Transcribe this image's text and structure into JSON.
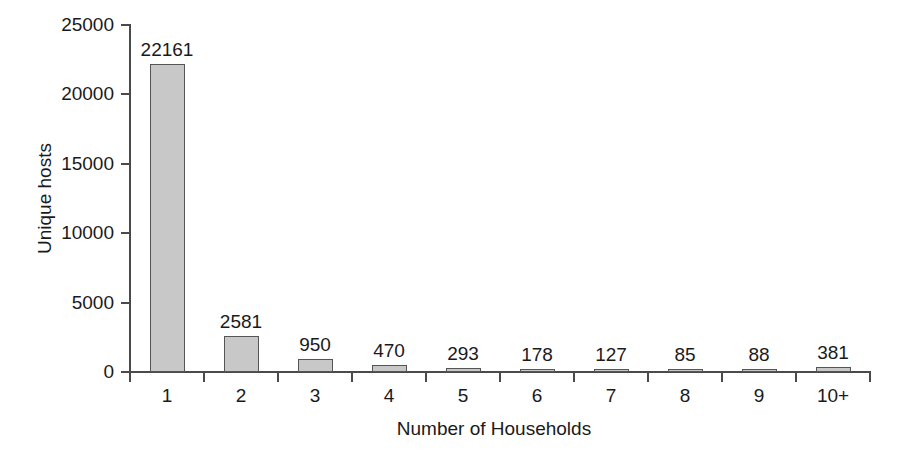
{
  "chart_data": {
    "type": "bar",
    "title": "",
    "subtitle": "",
    "xlabel": "Number of Households",
    "ylabel": "Unique hosts",
    "categories": [
      "1",
      "2",
      "3",
      "4",
      "5",
      "6",
      "7",
      "8",
      "9",
      "10+"
    ],
    "values": [
      22161,
      2581,
      950,
      470,
      293,
      178,
      127,
      85,
      88,
      381
    ],
    "value_labels": [
      "22161",
      "2581",
      "950",
      "470",
      "293",
      "178",
      "127",
      "85",
      "88",
      "381"
    ],
    "ylim": [
      0,
      25000
    ],
    "y_ticks": [
      0,
      5000,
      10000,
      15000,
      20000,
      25000
    ],
    "y_tick_labels": [
      "0",
      "5000",
      "10000",
      "15000",
      "20000",
      "25000"
    ],
    "grid": false,
    "legend": false,
    "legend_position": "none",
    "bar_fill_color": "#c8c8c8",
    "bar_border_color": "#555555",
    "axis_color": "#4a4a4a",
    "background_color": "#ffffff",
    "data_labels_shown": true
  }
}
